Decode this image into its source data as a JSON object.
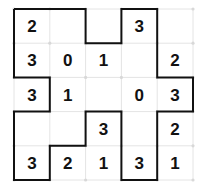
{
  "puzzle": {
    "type": "slitherlink",
    "rows": 5,
    "cols": 5,
    "clues": [
      [
        "2",
        "",
        "",
        "3",
        ""
      ],
      [
        "3",
        "0",
        "1",
        "",
        "2"
      ],
      [
        "3",
        "1",
        "",
        "0",
        "3"
      ],
      [
        "",
        "",
        "3",
        "",
        "2"
      ],
      [
        "3",
        "2",
        "1",
        "3",
        "1"
      ]
    ],
    "loop": [
      [
        0,
        0
      ],
      [
        2,
        0
      ],
      [
        2,
        1
      ],
      [
        3,
        1
      ],
      [
        3,
        0
      ],
      [
        4,
        0
      ],
      [
        4,
        2
      ],
      [
        5,
        2
      ],
      [
        5,
        3
      ],
      [
        4,
        3
      ],
      [
        4,
        5
      ],
      [
        3,
        5
      ],
      [
        3,
        3
      ],
      [
        2,
        3
      ],
      [
        2,
        4
      ],
      [
        1,
        4
      ],
      [
        1,
        5
      ],
      [
        0,
        5
      ],
      [
        0,
        3
      ],
      [
        1,
        3
      ],
      [
        1,
        2
      ],
      [
        0,
        2
      ],
      [
        0,
        0
      ]
    ],
    "colors": {
      "grid": "#e4e4e4",
      "dot": "#d8d8d8",
      "loop": "#111111",
      "clue": "#111111"
    }
  }
}
